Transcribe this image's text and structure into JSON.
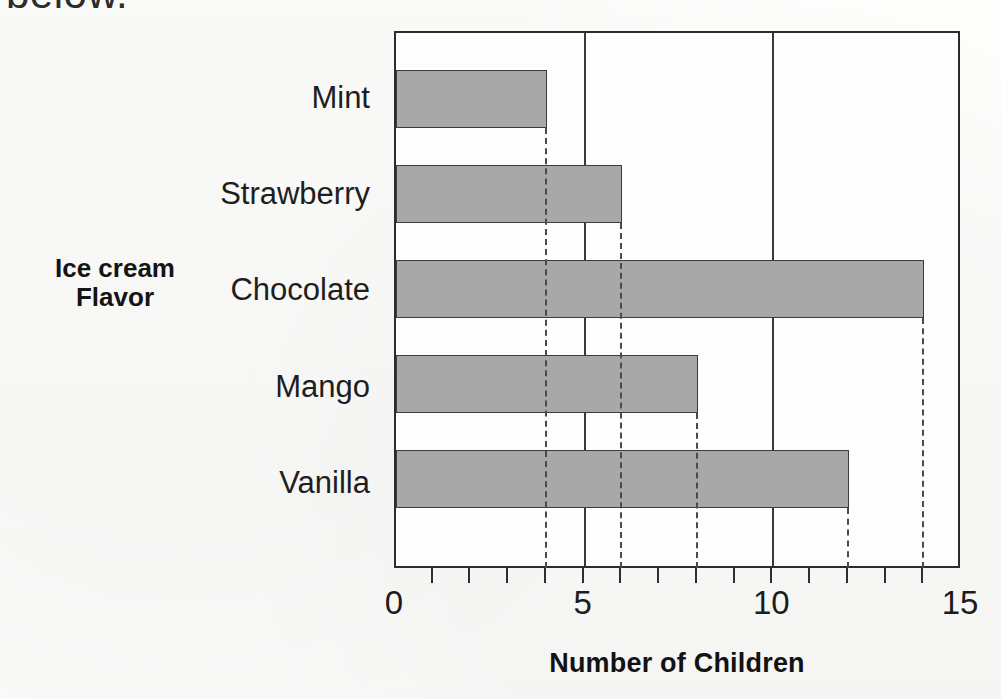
{
  "page": {
    "top_text_fragment": "below.",
    "background_color": "#fcfcfb"
  },
  "chart_data": {
    "type": "bar",
    "orientation": "horizontal",
    "title": "",
    "xlabel": "Number of Children",
    "ylabel": "Ice cream Flavor",
    "ylabel_line1": "Ice cream",
    "ylabel_line2": "Flavor",
    "categories": [
      "Mint",
      "Strawberry",
      "Chocolate",
      "Mango",
      "Vanilla"
    ],
    "values": [
      4,
      6,
      14,
      8,
      12
    ],
    "xlim": [
      0,
      15
    ],
    "xticks": [
      0,
      5,
      10,
      15
    ],
    "xtick_labels": [
      "0",
      "5",
      "10",
      "15"
    ],
    "minor_tick_interval": 1,
    "gridlines": [
      5,
      10
    ],
    "grid": true,
    "legend": null,
    "bar_color": "#a8a8a8",
    "bar_edge_color": "#3c3c3c",
    "leader_line_style": "dashed",
    "axis_color": "#2c2c2c"
  }
}
